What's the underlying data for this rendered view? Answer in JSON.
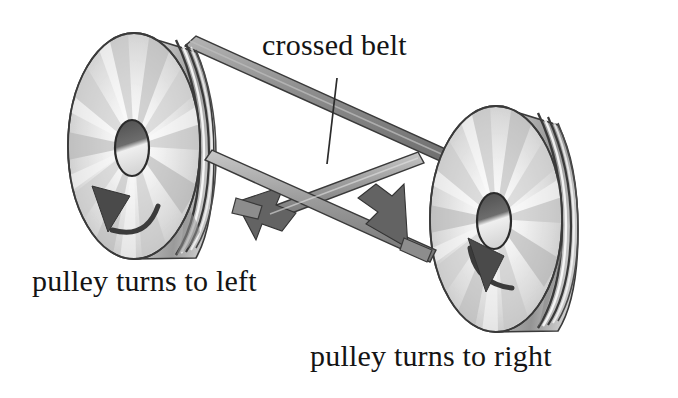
{
  "figure": {
    "background_color": "#ffffff",
    "width": 678,
    "height": 398
  },
  "labels": {
    "crossed_belt": "crossed belt",
    "left_pulley": "pulley turns to left",
    "right_pulley": "pulley turns to right"
  },
  "palette": {
    "ink": "#141414",
    "outline": "#2b2b2b",
    "belt_light": "#cfcfcf",
    "belt_mid": "#9a9a9a",
    "belt_dark": "#6e6e6e",
    "arrow_fill": "#4a4a4a",
    "face_light": "#f2f2f2",
    "face_mid": "#cccccc",
    "face_dark": "#a6a6a6",
    "rim_shadow": "#8c8c8c",
    "hub_dark": "#555555"
  },
  "parts": {
    "left_pulley": {
      "name": "left pulley",
      "center_x": 134,
      "center_y": 146,
      "rotation": "counterclockwise",
      "rotation_label": "turns to left",
      "hub_label": "bore"
    },
    "right_pulley": {
      "name": "right pulley",
      "center_x": 496,
      "center_y": 219,
      "rotation": "clockwise",
      "rotation_label": "turns to right",
      "hub_label": "bore"
    },
    "belt": {
      "name": "crossed belt",
      "style": "crossed",
      "strand_count": 2,
      "upper_strand_direction": "left-to-right descending",
      "lower_strand_direction": "crossing",
      "arrow_count": 2
    },
    "leader_line": {
      "name": "crossed belt leader",
      "from_x": 337,
      "from_y": 78,
      "to_x": 327,
      "to_y": 164
    }
  }
}
